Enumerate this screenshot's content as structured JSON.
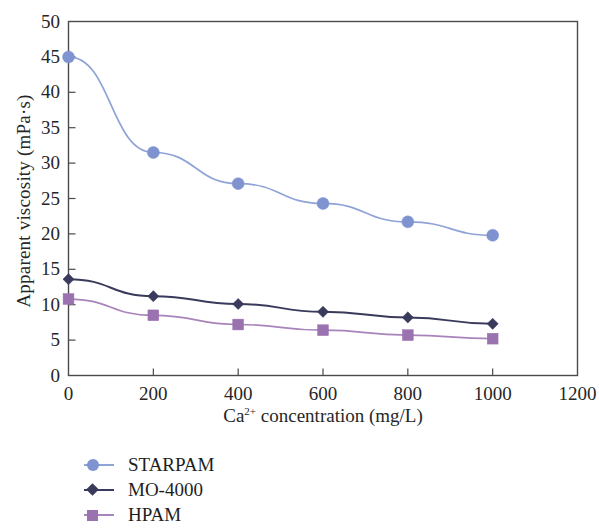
{
  "chart_data": {
    "type": "line",
    "title": "",
    "xlabel": "Ca2+ concentration (mg/L)",
    "xlabel_prefix": "Ca",
    "xlabel_sup": "2+",
    "xlabel_rest": " concentration (mg/L)",
    "ylabel": "Apparent viscosity (mPa·s)",
    "x": [
      0,
      200,
      400,
      600,
      800,
      1000
    ],
    "xlim": [
      0,
      1200
    ],
    "ylim": [
      0,
      50
    ],
    "xticks": [
      "0",
      "200",
      "400",
      "600",
      "800",
      "1000",
      "1200"
    ],
    "xtick_values": [
      0,
      200,
      400,
      600,
      800,
      1000,
      1200
    ],
    "yticks": [
      "0",
      "5",
      "10",
      "15",
      "20",
      "25",
      "30",
      "35",
      "40",
      "45",
      "50"
    ],
    "ytick_values": [
      0,
      5,
      10,
      15,
      20,
      25,
      30,
      35,
      40,
      45,
      50
    ],
    "grid": false,
    "legend_position": "below-left",
    "series": [
      {
        "name": "STARPAM",
        "marker": "circle",
        "color": "#7e93cf",
        "line_color": "#8fa3d8",
        "values": [
          45.0,
          31.5,
          27.1,
          24.3,
          21.7,
          19.8
        ]
      },
      {
        "name": "MO-4000",
        "marker": "diamond",
        "color": "#3a3a5c",
        "line_color": "#3a3a5c",
        "values": [
          13.6,
          11.2,
          10.1,
          9.0,
          8.2,
          7.3
        ]
      },
      {
        "name": "HPAM",
        "marker": "square",
        "color": "#9b72b0",
        "line_color": "#a984bb",
        "values": [
          10.8,
          8.5,
          7.2,
          6.4,
          5.7,
          5.2
        ]
      }
    ]
  },
  "axes": {
    "frame_color": "#4a4a4a",
    "background": "#ffffff"
  }
}
